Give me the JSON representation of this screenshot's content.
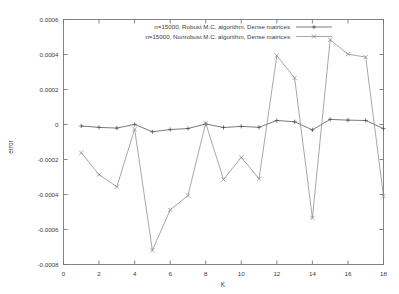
{
  "chart_data": {
    "type": "line",
    "title": "",
    "xlabel": "K",
    "ylabel": "error",
    "xlim": [
      0,
      18
    ],
    "ylim": [
      -0.0008,
      0.0006
    ],
    "grid": false,
    "legend_position": "top-center",
    "x_ticks": [
      0,
      2,
      4,
      6,
      8,
      10,
      12,
      14,
      16,
      18
    ],
    "x_tick_labels": [
      "0",
      "2",
      "4",
      "6",
      "8",
      "10",
      "12",
      "14",
      "16",
      "18"
    ],
    "y_ticks": [
      0.0006,
      0.0004,
      0.0002,
      0,
      -0.0002,
      -0.0004,
      -0.0006,
      -0.0008
    ],
    "y_tick_labels": [
      "0.0006",
      "0.0004",
      "0.0002",
      "0",
      "-0.0002",
      "-0.0004",
      "-0.0006",
      "-0.0008"
    ],
    "x": [
      1,
      2,
      3,
      4,
      5,
      6,
      7,
      8,
      9,
      10,
      11,
      12,
      13,
      14,
      15,
      16,
      17,
      18
    ],
    "series": [
      {
        "name": "n=15000, Robust M.C. algorithm, Dense matrices",
        "color": "#4d4d4d",
        "marker": "plus",
        "values": [
          -8.5e-06,
          -1.65e-05,
          -2.05e-05,
          5e-07,
          -4.15e-05,
          -2.9e-05,
          -2.3e-05,
          3e-06,
          -1.7e-05,
          -1.1e-05,
          -1.6e-05,
          2.3e-05,
          1.55e-05,
          -3.1e-05,
          2.9e-05,
          2.5e-05,
          2.3e-05,
          -2.35e-05
        ]
      },
      {
        "name": "n=15000, Nonrobust M.C. algorithm, Dense matrices",
        "color": "#8a8a8a",
        "marker": "cross",
        "values": [
          -0.000162,
          -0.000286,
          -0.000356,
          -2.7e-05,
          -0.000719,
          -0.000488,
          -0.000406,
          8e-06,
          -0.000314,
          -0.000188,
          -0.00031,
          0.000393,
          0.000266,
          -0.000534,
          0.000484,
          0.000402,
          0.000385,
          -0.00041
        ]
      }
    ]
  }
}
